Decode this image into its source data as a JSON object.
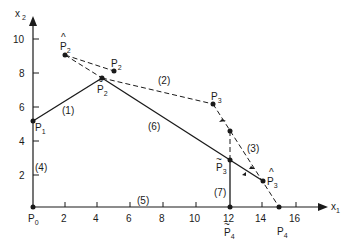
{
  "axes": {
    "x_label": "x",
    "x_sub": "1",
    "y_label": "x",
    "y_sub": "2",
    "x_ticks": [
      "2",
      "4",
      "6",
      "8",
      "10",
      "12",
      "14",
      "16"
    ],
    "y_ticks": [
      "2",
      "4",
      "6",
      "8",
      "10"
    ]
  },
  "points": {
    "p0": {
      "base": "P",
      "sub": "0"
    },
    "p1": {
      "base": "P",
      "sub": "1"
    },
    "p2": {
      "base": "P",
      "sub": "2"
    },
    "p2_hat": {
      "base": "P",
      "sub": "2",
      "accent": "^"
    },
    "p2_tilde": {
      "base": "P",
      "sub": "2",
      "accent": "~"
    },
    "p3": {
      "base": "P",
      "sub": "3"
    },
    "p3_hat": {
      "base": "P",
      "sub": "3",
      "accent": "^"
    },
    "p3_tilde": {
      "base": "P",
      "sub": "3",
      "accent": "~"
    },
    "p4": {
      "base": "P",
      "sub": "4"
    },
    "p4_tilde": {
      "base": "P",
      "sub": "4",
      "accent": "~"
    }
  },
  "constraints": {
    "c1": "(1)",
    "c2": "(2)",
    "c3": "(3)",
    "c4": "(4)",
    "c5": "(5)",
    "c6": "(6)",
    "c7": "(7)"
  },
  "coordinates": {
    "P0": [
      0,
      0
    ],
    "P1": [
      0,
      5
    ],
    "P2_tilde": [
      4.3,
      7.6
    ],
    "P2_hat": [
      2,
      9
    ],
    "P2": [
      5,
      8
    ],
    "P3": [
      11,
      6.1
    ],
    "intersection": [
      12,
      4.5
    ],
    "P3_tilde": [
      12,
      2.8
    ],
    "P3_hat": [
      14,
      1.6
    ],
    "P4": [
      15,
      0
    ],
    "P4_tilde": [
      12,
      0
    ]
  },
  "colors": {
    "ink": "#1a1a1a",
    "background": "#ffffff"
  }
}
